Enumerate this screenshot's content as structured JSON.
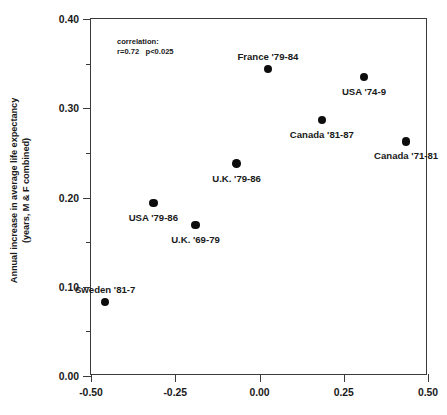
{
  "chart_data": {
    "type": "scatter",
    "title": "",
    "xlabel": "",
    "ylabel": "Annual increase in average life expectancy",
    "ylabel_line2": "(years, M & F combined)",
    "xlim": [
      -0.5,
      0.5
    ],
    "ylim": [
      0.0,
      0.4
    ],
    "grid": false,
    "legend": "none",
    "xticks": [
      "-0.50",
      "-0.25",
      "0.00",
      "0.25",
      "0.50"
    ],
    "xtick_values": [
      -0.5,
      -0.25,
      0.0,
      0.25,
      0.5
    ],
    "yticks": [
      "0.00",
      "0.10",
      "0.20",
      "0.30",
      "0.40"
    ],
    "ytick_values": [
      0.0,
      0.1,
      0.2,
      0.3,
      0.4
    ],
    "yticks_minor": [
      0.05,
      0.15,
      0.25,
      0.35
    ],
    "annotation": {
      "line1": "correlation:",
      "line2": "r=0.72   p<0.025",
      "r": 0.72,
      "p": "<0.025"
    },
    "marker_color": "#0d0d0d",
    "axis_color": "#3a3a3a",
    "points": [
      {
        "label": "Sweden '81-7",
        "x": -0.458,
        "y": 0.083,
        "label_pos": "above"
      },
      {
        "label": "USA '79-86",
        "x": -0.315,
        "y": 0.194,
        "label_pos": "below"
      },
      {
        "label": "U.K. '69-79",
        "x": -0.19,
        "y": 0.169,
        "label_pos": "below"
      },
      {
        "label": "U.K. '79-86",
        "x": -0.068,
        "y": 0.238,
        "label_pos": "below"
      },
      {
        "label": "France '79-84",
        "x": 0.025,
        "y": 0.344,
        "label_pos": "above"
      },
      {
        "label": "Canada '81-87",
        "x": 0.185,
        "y": 0.287,
        "label_pos": "below"
      },
      {
        "label": "USA '74-9",
        "x": 0.31,
        "y": 0.335,
        "label_pos": "below"
      },
      {
        "label": "Canada '71-81",
        "x": 0.435,
        "y": 0.263,
        "label_pos": "below"
      }
    ]
  }
}
